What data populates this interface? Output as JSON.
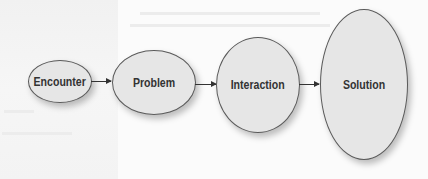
{
  "diagram": {
    "type": "flow",
    "nodes": [
      {
        "id": "encounter",
        "label": "Encounter"
      },
      {
        "id": "problem",
        "label": "Problem"
      },
      {
        "id": "interaction",
        "label": "Interaction"
      },
      {
        "id": "solution",
        "label": "Solution"
      }
    ],
    "edges": [
      {
        "from": "encounter",
        "to": "problem"
      },
      {
        "from": "problem",
        "to": "interaction"
      },
      {
        "from": "interaction",
        "to": "solution"
      }
    ],
    "colors": {
      "node_fill": "#e6e6e6",
      "node_border": "#5a5a5a",
      "text": "#333333",
      "arrow": "#333333"
    }
  }
}
